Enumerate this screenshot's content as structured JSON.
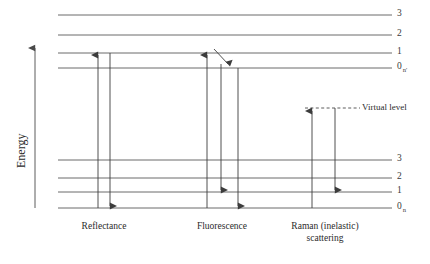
{
  "figure": {
    "type": "energy-level-diagram",
    "axis": {
      "label": "Energy",
      "direction": "up"
    },
    "background_color": "#ffffff",
    "line_color": "#5a5a5a",
    "arrow_color": "#3c3c3c"
  },
  "excited_state": {
    "group_subscript": "n'",
    "levels": [
      {
        "label": "3",
        "y": 15
      },
      {
        "label": "2",
        "y": 35
      },
      {
        "label": "1",
        "y": 53
      },
      {
        "label": "0",
        "y": 68,
        "subscript": "n'"
      }
    ]
  },
  "ground_state": {
    "group_subscript": "n",
    "levels": [
      {
        "label": "3",
        "y": 160
      },
      {
        "label": "2",
        "y": 178
      },
      {
        "label": "1",
        "y": 192
      },
      {
        "label": "0",
        "y": 208,
        "subscript": "n"
      }
    ]
  },
  "virtual_level": {
    "label": "Virtual level",
    "y": 108,
    "style": "dashed"
  },
  "processes": [
    {
      "name": "reflectance",
      "label": "Reflectance",
      "label_lines": [
        "Reflectance"
      ],
      "center_x": 104,
      "transitions": [
        {
          "kind": "absorption",
          "direction": "up",
          "x": 98,
          "from_level": "0 (n)",
          "to_level": "1 (n')"
        },
        {
          "kind": "emission",
          "direction": "down",
          "x": 110,
          "from_level": "1 (n')",
          "to_level": "0 (n)"
        }
      ]
    },
    {
      "name": "fluorescence",
      "label": "Fluorescence",
      "label_lines": [
        "Fluorescence"
      ],
      "center_x": 222,
      "transitions": [
        {
          "kind": "absorption",
          "direction": "up",
          "x": 207,
          "from_level": "0 (n)",
          "to_level": "1 (n')"
        },
        {
          "kind": "relaxation",
          "direction": "diagonal",
          "from_level": "1 (n')",
          "to_level": "0 (n')"
        },
        {
          "kind": "emission",
          "direction": "down",
          "x": 221,
          "from_level": "0 (n')",
          "to_level": "1 (n)"
        },
        {
          "kind": "emission",
          "direction": "down",
          "x": 238,
          "from_level": "0 (n')",
          "to_level": "0 (n)"
        }
      ]
    },
    {
      "name": "raman-inelastic-scattering",
      "label": "Raman (inelastic) scattering",
      "label_lines": [
        "Raman (inelastic)",
        "scattering"
      ],
      "center_x": 325,
      "transitions": [
        {
          "kind": "excitation",
          "direction": "up",
          "x": 312,
          "from_level": "0 (n)",
          "to_level": "virtual"
        },
        {
          "kind": "scattered",
          "direction": "down",
          "x": 335,
          "from_level": "virtual",
          "to_level": "1 (n)"
        }
      ]
    }
  ],
  "geometry": {
    "line_x_start": 58,
    "line_x_end": 392,
    "label_x": 397,
    "axis_x": 35,
    "axis_top_y": 45,
    "axis_bottom_y": 208
  }
}
